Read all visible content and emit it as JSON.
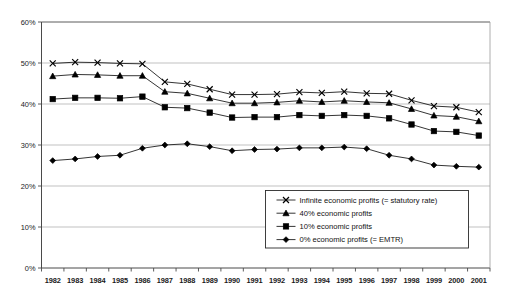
{
  "chart_data": {
    "type": "line",
    "title": "",
    "subtitle": "",
    "xlabel": "",
    "ylabel": "",
    "grid": true,
    "legend_position": "inside-bottom-right",
    "ylim": [
      0,
      60
    ],
    "ytick_labels": [
      "0%",
      "10%",
      "20%",
      "30%",
      "40%",
      "50%",
      "60%"
    ],
    "ytick_values": [
      0,
      10,
      20,
      30,
      40,
      50,
      60
    ],
    "categories": [
      "1982",
      "1983",
      "1984",
      "1985",
      "1986",
      "1987",
      "1988",
      "1989",
      "1990",
      "1991",
      "1992",
      "1993",
      "1994",
      "1995",
      "1996",
      "1997",
      "1998",
      "1999",
      "2000",
      "2001"
    ],
    "series": [
      {
        "name": "Infinite economic profits (= statutory rate)",
        "marker": "cross",
        "color": "#000000",
        "values": [
          49.9,
          50.2,
          50.1,
          49.9,
          49.8,
          45.4,
          44.9,
          43.6,
          42.3,
          42.3,
          42.4,
          42.9,
          42.7,
          43.0,
          42.6,
          42.5,
          40.9,
          39.5,
          39.2,
          38.0
        ]
      },
      {
        "name": "40% economic profits",
        "marker": "triangle",
        "color": "#000000",
        "values": [
          46.8,
          47.2,
          47.1,
          46.9,
          46.9,
          43.0,
          42.6,
          41.4,
          40.2,
          40.2,
          40.4,
          40.8,
          40.5,
          40.8,
          40.5,
          40.3,
          38.8,
          37.2,
          36.9,
          35.8
        ]
      },
      {
        "name": "10% economic profits",
        "marker": "square",
        "color": "#000000",
        "values": [
          41.2,
          41.5,
          41.5,
          41.4,
          41.8,
          39.2,
          39.0,
          37.9,
          36.7,
          36.8,
          36.8,
          37.3,
          37.1,
          37.3,
          37.1,
          36.5,
          35.0,
          33.4,
          33.2,
          32.3
        ]
      },
      {
        "name": "0% economic profits (= EMTR)",
        "marker": "diamond",
        "color": "#000000",
        "values": [
          26.2,
          26.6,
          27.2,
          27.5,
          29.2,
          30.0,
          30.3,
          29.6,
          28.6,
          28.9,
          29.0,
          29.3,
          29.3,
          29.5,
          29.1,
          27.5,
          26.6,
          25.1,
          24.8,
          24.6
        ]
      }
    ]
  },
  "legend": {
    "entries": [
      {
        "label": "Infinite economic profits (= statutory rate)",
        "marker": "cross"
      },
      {
        "label": "40% economic profits",
        "marker": "triangle"
      },
      {
        "label": "10% economic profits",
        "marker": "square"
      },
      {
        "label": "0% economic profits (= EMTR)",
        "marker": "diamond"
      }
    ]
  }
}
